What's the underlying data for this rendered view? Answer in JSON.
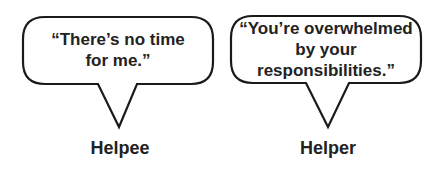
{
  "figure": {
    "speakers": [
      {
        "role": "Helpee",
        "quote_lines": [
          "“There’s no time",
          "for me.”"
        ]
      },
      {
        "role": "Helper",
        "quote_lines": [
          "“You’re overwhelmed",
          "by your",
          "responsibilities.”"
        ]
      }
    ],
    "colors": {
      "stroke": "#1a1a1a",
      "fill": "#ffffff",
      "text": "#222222"
    }
  }
}
